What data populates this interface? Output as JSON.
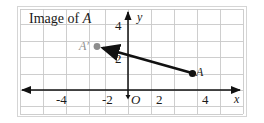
{
  "figure": {
    "caption": "Image of A",
    "caption_plain": "Image of ",
    "caption_italic": "A",
    "axis": {
      "x_label": "x",
      "y_label": "y",
      "origin_label": "O",
      "x_ticks": [
        "-4",
        "-2",
        "2",
        "4"
      ],
      "y_ticks": [
        "4",
        "2"
      ],
      "x_range": [
        -6,
        6
      ],
      "y_range": [
        -1,
        5
      ],
      "grid": "on",
      "grid_color": "#c9c9c9",
      "axis_color": "#1a1a1a"
    },
    "points": [
      {
        "name": "A",
        "label": "A",
        "x": 4,
        "y": 1,
        "color": "#111111",
        "style": "filled"
      },
      {
        "name": "A-prime",
        "label": "A′",
        "x": -2,
        "y": 3,
        "color": "#8d8d8d",
        "style": "filled"
      }
    ],
    "vector": {
      "name": "translation-arrow",
      "from": {
        "x": 4,
        "y": 1
      },
      "to": {
        "x": -2,
        "y": 3
      },
      "color": "#111111",
      "arrowhead": "at-end"
    }
  }
}
